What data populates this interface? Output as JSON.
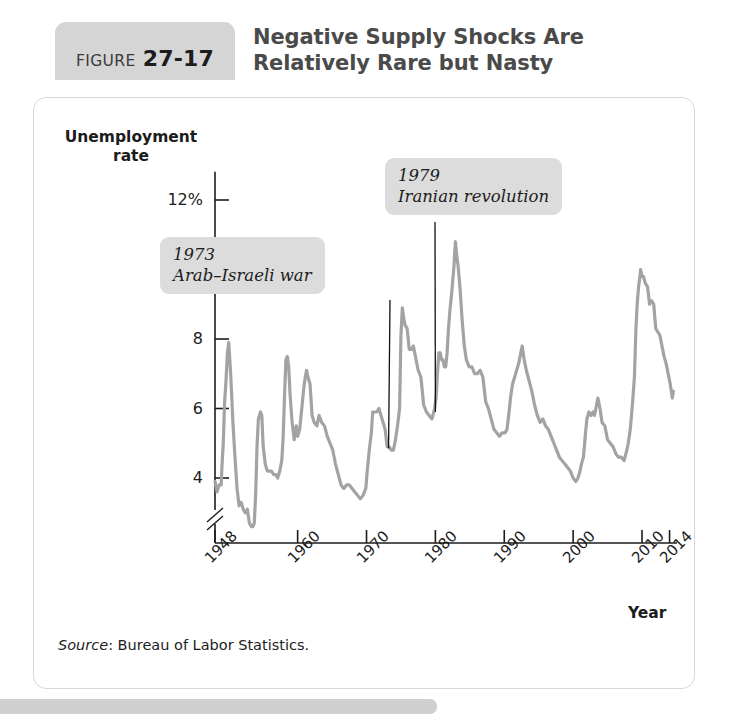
{
  "figure": {
    "badge_word": "FIGURE",
    "badge_number": "27-17",
    "title_line1": "Negative Supply Shocks Are",
    "title_line2": "Relatively Rare but Nasty",
    "source_label": "Source",
    "source_rest": ": Bureau of Labor Statistics."
  },
  "colors": {
    "line": "#a3a3a3",
    "axis": "#1c1c1c",
    "callout_bg": "#dcdcdc",
    "badge_bg": "#d5d5d5",
    "card_border": "#d8d8d8",
    "title_text": "#4a4a4a"
  },
  "annotations": [
    {
      "id": "1973",
      "year_label": "1973",
      "event_label": "Arab–Israeli war",
      "anchor_x": 1973.2,
      "anchor_y": 4.85
    },
    {
      "id": "1979",
      "year_label": "1979",
      "event_label": "Iranian revolution",
      "anchor_x": 1980.0,
      "anchor_y": 5.9
    }
  ],
  "chart_data": {
    "type": "line",
    "title": "Negative Supply Shocks Are Relatively Rare but Nasty",
    "xlabel": "Year",
    "ylabel": "Unemployment rate",
    "ylabel_line1": "Unemployment",
    "ylabel_line2": "rate",
    "grid": false,
    "legend": null,
    "axis_break_y": true,
    "xlim": [
      1948,
      2014.6
    ],
    "ylim": [
      2.5,
      12.7
    ],
    "ytick_labels": [
      "12%",
      "10",
      "8",
      "6",
      "4"
    ],
    "yticks": [
      12,
      10,
      8,
      6,
      4
    ],
    "xtick_labels": [
      "1948",
      "1960",
      "1970",
      "1980",
      "1990",
      "2000",
      "2010",
      "2014"
    ],
    "xticks": [
      1948,
      1960,
      1970,
      1980,
      1990,
      2000,
      2010,
      2014
    ],
    "series": [
      {
        "name": "Unemployment rate",
        "color": "#a3a3a3",
        "x": [
          1948.0,
          1948.3,
          1948.6,
          1948.9,
          1949.0,
          1949.2,
          1949.4,
          1949.6,
          1949.8,
          1950.0,
          1950.3,
          1950.6,
          1950.9,
          1951.2,
          1951.5,
          1951.8,
          1952.1,
          1952.4,
          1952.7,
          1953.0,
          1953.3,
          1953.5,
          1953.7,
          1953.9,
          1954.1,
          1954.3,
          1954.6,
          1954.8,
          1955.0,
          1955.3,
          1955.6,
          1955.9,
          1956.2,
          1956.5,
          1956.8,
          1957.1,
          1957.4,
          1957.7,
          1957.9,
          1958.1,
          1958.3,
          1958.5,
          1958.7,
          1958.9,
          1959.2,
          1959.5,
          1959.8,
          1960.0,
          1960.3,
          1960.6,
          1960.9,
          1961.1,
          1961.3,
          1961.5,
          1961.8,
          1962.1,
          1962.4,
          1962.8,
          1963.1,
          1963.5,
          1963.9,
          1964.3,
          1964.7,
          1965.1,
          1965.5,
          1965.9,
          1966.3,
          1966.7,
          1967.1,
          1967.5,
          1967.9,
          1968.3,
          1968.7,
          1969.1,
          1969.5,
          1969.9,
          1970.1,
          1970.4,
          1970.7,
          1970.9,
          1971.2,
          1971.5,
          1971.8,
          1972.1,
          1972.4,
          1972.7,
          1973.0,
          1973.3,
          1973.6,
          1973.9,
          1974.2,
          1974.5,
          1974.8,
          1975.0,
          1975.2,
          1975.4,
          1975.6,
          1975.9,
          1976.2,
          1976.5,
          1976.8,
          1977.1,
          1977.5,
          1977.9,
          1978.3,
          1978.7,
          1979.1,
          1979.5,
          1979.9,
          1980.1,
          1980.3,
          1980.5,
          1980.7,
          1980.9,
          1981.1,
          1981.3,
          1981.5,
          1981.7,
          1981.9,
          1982.1,
          1982.4,
          1982.7,
          1982.9,
          1983.1,
          1983.3,
          1983.6,
          1983.9,
          1984.2,
          1984.5,
          1984.9,
          1985.3,
          1985.7,
          1986.1,
          1986.5,
          1986.9,
          1987.3,
          1987.7,
          1988.1,
          1988.5,
          1988.9,
          1989.3,
          1989.7,
          1990.1,
          1990.4,
          1990.7,
          1990.9,
          1991.2,
          1991.5,
          1991.8,
          1992.1,
          1992.4,
          1992.6,
          1992.9,
          1993.2,
          1993.6,
          1994.0,
          1994.4,
          1994.8,
          1995.2,
          1995.6,
          1996.0,
          1996.4,
          1996.8,
          1997.2,
          1997.6,
          1998.0,
          1998.4,
          1998.8,
          1999.2,
          1999.6,
          2000.0,
          2000.4,
          2000.7,
          2001.0,
          2001.2,
          2001.5,
          2001.8,
          2002.0,
          2002.3,
          2002.6,
          2002.9,
          2003.1,
          2003.4,
          2003.6,
          2003.9,
          2004.2,
          2004.6,
          2005.0,
          2005.4,
          2005.8,
          2006.2,
          2006.6,
          2007.0,
          2007.4,
          2007.8,
          2008.0,
          2008.3,
          2008.6,
          2008.9,
          2009.1,
          2009.3,
          2009.5,
          2009.7,
          2009.8,
          2010.0,
          2010.2,
          2010.5,
          2010.8,
          2011.1,
          2011.4,
          2011.7,
          2012.0,
          2012.3,
          2012.6,
          2012.9,
          2013.2,
          2013.5,
          2013.8,
          2014.1,
          2014.4,
          2014.55
        ],
        "y": [
          3.9,
          3.6,
          3.8,
          3.8,
          4.3,
          5.0,
          6.2,
          6.8,
          7.6,
          7.9,
          6.9,
          5.6,
          4.6,
          3.7,
          3.2,
          3.3,
          3.1,
          3.0,
          3.1,
          2.7,
          2.6,
          2.6,
          2.7,
          3.5,
          4.9,
          5.7,
          5.9,
          5.8,
          4.9,
          4.4,
          4.2,
          4.2,
          4.2,
          4.1,
          4.1,
          4.0,
          4.2,
          4.5,
          5.2,
          6.4,
          7.4,
          7.5,
          7.2,
          6.4,
          5.6,
          5.1,
          5.5,
          5.2,
          5.4,
          6.0,
          6.6,
          6.9,
          7.1,
          6.9,
          6.7,
          5.8,
          5.6,
          5.5,
          5.8,
          5.6,
          5.5,
          5.2,
          5.0,
          4.8,
          4.4,
          4.1,
          3.8,
          3.7,
          3.8,
          3.8,
          3.7,
          3.6,
          3.5,
          3.4,
          3.5,
          3.7,
          4.2,
          4.8,
          5.3,
          5.9,
          5.9,
          5.9,
          6.0,
          5.8,
          5.6,
          5.4,
          4.9,
          4.9,
          4.8,
          4.8,
          5.1,
          5.5,
          6.0,
          8.1,
          8.9,
          8.6,
          8.4,
          8.3,
          7.7,
          7.7,
          7.8,
          7.5,
          7.1,
          6.9,
          6.1,
          5.9,
          5.8,
          5.7,
          6.0,
          6.3,
          7.0,
          7.6,
          7.6,
          7.4,
          7.4,
          7.2,
          7.2,
          7.6,
          8.3,
          8.8,
          9.4,
          10.1,
          10.8,
          10.4,
          10.1,
          9.4,
          8.5,
          7.8,
          7.4,
          7.2,
          7.2,
          7.0,
          7.0,
          7.1,
          6.9,
          6.2,
          6.0,
          5.7,
          5.4,
          5.3,
          5.2,
          5.3,
          5.3,
          5.4,
          5.9,
          6.3,
          6.7,
          6.9,
          7.1,
          7.3,
          7.6,
          7.8,
          7.4,
          7.1,
          6.8,
          6.5,
          6.1,
          5.8,
          5.6,
          5.7,
          5.5,
          5.4,
          5.2,
          5.0,
          4.8,
          4.6,
          4.5,
          4.4,
          4.3,
          4.2,
          4.0,
          3.9,
          4.0,
          4.2,
          4.4,
          4.6,
          5.3,
          5.7,
          5.9,
          5.8,
          5.9,
          5.8,
          6.1,
          6.3,
          6.0,
          5.6,
          5.5,
          5.1,
          5.0,
          4.9,
          4.7,
          4.6,
          4.6,
          4.5,
          4.8,
          5.0,
          5.4,
          6.1,
          6.9,
          8.2,
          9.0,
          9.5,
          9.8,
          10.0,
          9.8,
          9.8,
          9.6,
          9.5,
          9.0,
          9.1,
          9.0,
          8.3,
          8.2,
          8.1,
          7.8,
          7.5,
          7.3,
          7.0,
          6.7,
          6.3,
          6.5
        ],
        "first_year": 1948,
        "last_year": 2014,
        "max_value": 10.8,
        "max_year": 1982,
        "min_value": 2.6,
        "min_year": 1953
      }
    ]
  }
}
